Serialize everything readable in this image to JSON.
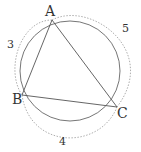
{
  "diagram": {
    "vertices": {
      "A": {
        "label": "A",
        "x": 52,
        "y": 20
      },
      "B": {
        "label": "B",
        "x": 22,
        "y": 95
      },
      "C": {
        "label": "C",
        "x": 117,
        "y": 107
      }
    },
    "circle": {
      "cx": 70,
      "cy": 71,
      "r": 50
    },
    "side_lengths": {
      "AB": "3",
      "BC": "4",
      "CA": "5"
    },
    "colors": {
      "stroke": "#555555",
      "dashed": "#999999"
    }
  }
}
